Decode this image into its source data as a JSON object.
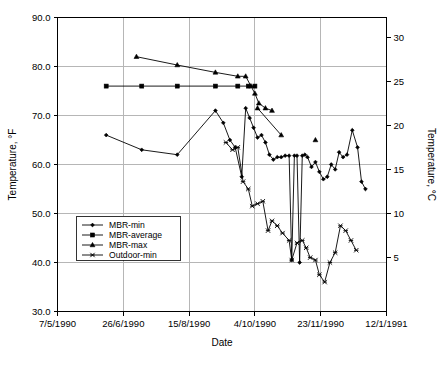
{
  "chart_data": {
    "type": "line",
    "title": "",
    "xlabel": "Date",
    "ylabel": "Temperature, °F",
    "y2label": "Temperature, °C",
    "grid": true,
    "legend_position": "inside-lower-left",
    "xlim": [
      0,
      250
    ],
    "ylim": [
      30.0,
      90.0
    ],
    "y2lim": [
      -1.1,
      32.2
    ],
    "x_tick_labels": [
      "7/5/1990",
      "26/6/1990",
      "15/8/1990",
      "4/10/1990",
      "23/11/1990",
      "12/1/1991"
    ],
    "x_tick_values": [
      0,
      50,
      100,
      150,
      200,
      250
    ],
    "y_tick_labels": [
      "30.0",
      "40.0",
      "50.0",
      "60.0",
      "70.0",
      "80.0",
      "90.0"
    ],
    "y_tick_values": [
      30.0,
      40.0,
      50.0,
      60.0,
      70.0,
      80.0,
      90.0
    ],
    "y2_tick_labels": [
      "5",
      "10",
      "15",
      "20",
      "25",
      "30"
    ],
    "y2_tick_values": [
      5,
      10,
      15,
      20,
      25,
      30
    ],
    "series": [
      {
        "name": "MBR-min",
        "marker": "diamond",
        "points": [
          [
            37,
            66.0
          ],
          [
            64,
            63.0
          ],
          [
            91,
            62.0
          ],
          [
            120,
            71.0
          ],
          [
            126,
            68.5
          ],
          [
            131,
            65.0
          ],
          [
            135,
            63.5
          ],
          [
            140,
            57.5
          ],
          [
            143,
            71.5
          ],
          [
            146,
            69.5
          ],
          [
            149,
            67.5
          ],
          [
            152,
            65.5
          ],
          [
            155,
            66.0
          ],
          [
            158,
            64.5
          ],
          [
            161,
            62.0
          ],
          [
            164,
            61.0
          ],
          [
            167,
            61.5
          ],
          [
            170,
            61.5
          ],
          [
            173,
            61.8
          ],
          [
            176,
            61.8
          ],
          [
            178,
            40.5
          ],
          [
            180,
            61.8
          ],
          [
            182,
            61.8
          ],
          [
            184,
            40.0
          ],
          [
            186,
            61.8
          ],
          [
            188,
            62.0
          ],
          [
            190,
            61.5
          ],
          [
            193,
            59.5
          ],
          [
            196,
            60.5
          ],
          [
            199,
            58.5
          ],
          [
            202,
            57.0
          ],
          [
            205,
            57.5
          ],
          [
            208,
            60.0
          ],
          [
            211,
            59.0
          ],
          [
            214,
            62.5
          ],
          [
            217,
            61.5
          ],
          [
            220,
            62.0
          ],
          [
            224,
            67.0
          ],
          [
            228,
            63.5
          ],
          [
            231,
            56.5
          ],
          [
            234,
            55.0
          ]
        ]
      },
      {
        "name": "MBR-average",
        "marker": "square",
        "points": [
          [
            37,
            76.0
          ],
          [
            64,
            76.0
          ],
          [
            91,
            76.0
          ],
          [
            120,
            76.0
          ],
          [
            137,
            76.0
          ],
          [
            145,
            76.0
          ],
          [
            150,
            76.0
          ]
        ]
      },
      {
        "name": "MBR-max",
        "marker": "triangle",
        "points": [
          [
            60,
            82.0
          ],
          [
            91,
            80.3
          ],
          [
            120,
            78.8
          ],
          [
            137,
            78.0
          ],
          [
            143,
            78.0
          ],
          [
            147,
            76.0
          ],
          [
            150,
            74.5
          ],
          [
            153,
            72.5
          ],
          [
            158,
            71.5
          ],
          [
            163,
            71.0
          ]
        ]
      },
      {
        "name": "MBR-max-pt2",
        "marker": "triangle",
        "points": [
          [
            152,
            71.5
          ],
          [
            170,
            66.0
          ]
        ]
      },
      {
        "name": "MBR-max-pt3",
        "marker": "triangle",
        "points": [
          [
            196,
            65.0
          ]
        ]
      },
      {
        "name": "Outdoor-min",
        "marker": "x",
        "points": [
          [
            128,
            64.5
          ],
          [
            133,
            63.0
          ],
          [
            137,
            63.5
          ],
          [
            141,
            56.5
          ],
          [
            145,
            55.0
          ],
          [
            148,
            51.5
          ],
          [
            152,
            52.0
          ],
          [
            156,
            52.5
          ],
          [
            160,
            46.5
          ],
          [
            163,
            48.5
          ],
          [
            167,
            47.5
          ],
          [
            171,
            46.0
          ],
          [
            176,
            44.5
          ],
          [
            178,
            40.5
          ],
          [
            182,
            44.0
          ],
          [
            186,
            44.5
          ],
          [
            189,
            43.0
          ],
          [
            192,
            41.0
          ],
          [
            196,
            40.5
          ],
          [
            199,
            37.5
          ],
          [
            203,
            36.0
          ],
          [
            207,
            40.0
          ],
          [
            211,
            42.0
          ],
          [
            215,
            47.5
          ],
          [
            219,
            46.5
          ],
          [
            223,
            44.5
          ],
          [
            227,
            42.5
          ]
        ]
      }
    ],
    "legend_entries": [
      {
        "label": "MBR-min",
        "marker": "diamond"
      },
      {
        "label": "MBR-average",
        "marker": "square"
      },
      {
        "label": "MBR-max",
        "marker": "triangle"
      },
      {
        "label": "Outdoor-min",
        "marker": "x"
      }
    ]
  },
  "colors": {
    "ink": "#000000",
    "grid": "#b6b6b6",
    "background": "#ffffff"
  }
}
